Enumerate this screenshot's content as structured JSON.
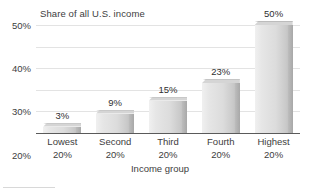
{
  "chart_data": {
    "type": "bar",
    "title": "Share of all U.S. income",
    "xlabel": "Income group",
    "ylabel": "",
    "categories": [
      "Lowest 20%",
      "Second 20%",
      "Third 20%",
      "Fourth 20%",
      "Highest 20%"
    ],
    "category_lines": [
      {
        "line1": "Lowest",
        "line2": "20%"
      },
      {
        "line1": "Second",
        "line2": "20%"
      },
      {
        "line1": "Third",
        "line2": "20%"
      },
      {
        "line1": "Fourth",
        "line2": "20%"
      },
      {
        "line1": "Highest",
        "line2": "20%"
      }
    ],
    "values": [
      3,
      9,
      15,
      23,
      50
    ],
    "value_labels": [
      "3%",
      "9%",
      "15%",
      "23%",
      "50%"
    ],
    "ylim": [
      0,
      50
    ],
    "yticks": [
      0,
      10,
      20,
      30,
      40,
      50
    ],
    "ytick_labels": [
      "0%",
      "10%",
      "20%",
      "30%",
      "40%",
      "50%"
    ],
    "grid": true,
    "legend": "none",
    "colors": {
      "bar_light": "#f0f0f0",
      "bar_mid": "#dcdcdc",
      "bar_dark": "#b3b3b3",
      "bar_side": "#a8a8a8",
      "gridline": "#e3e3e3",
      "axis": "#5a5a5a",
      "text": "#3d3d3d",
      "background": "#ffffff"
    }
  }
}
